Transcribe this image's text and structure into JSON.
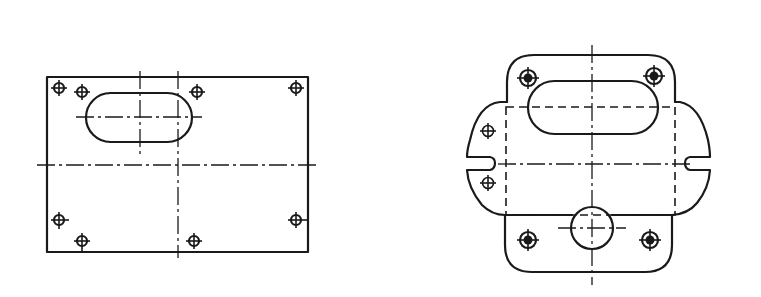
{
  "figure": {
    "type": "technical-drawing",
    "views": [
      {
        "id": "left-view",
        "description": "Rectangular plate with oblong slot and eight mounting holes",
        "outline_rect": {
          "x": 47,
          "y": 77,
          "w": 261,
          "h": 175
        },
        "slot": {
          "x": 86,
          "y": 93,
          "w": 106,
          "h": 49
        },
        "center_lines": {
          "horizontal": {
            "y": 165,
            "x1": 37,
            "x2": 318
          },
          "vertical_main": {
            "x": 178,
            "y1": 71,
            "y2": 258
          },
          "slot_horizontal": {
            "y": 117,
            "x1": 76,
            "x2": 202
          },
          "slot_vertical": {
            "x": 140,
            "y1": 71,
            "y2": 158
          }
        },
        "holes": [
          {
            "cx": 59,
            "cy": 88
          },
          {
            "cx": 82,
            "cy": 92
          },
          {
            "cx": 197,
            "cy": 92
          },
          {
            "cx": 296,
            "cy": 88
          },
          {
            "cx": 59,
            "cy": 220
          },
          {
            "cx": 82,
            "cy": 241
          },
          {
            "cx": 194,
            "cy": 241
          },
          {
            "cx": 296,
            "cy": 220
          }
        ]
      },
      {
        "id": "right-view",
        "description": "Plate with rounded lobes, side notches, oblong slot, hidden rectangle, and round boss",
        "center_x": 592,
        "slot": {
          "x": 528,
          "y": 81,
          "w": 130,
          "h": 53
        },
        "hidden_rect": {
          "x": 506,
          "y": 107,
          "w": 169,
          "h": 108
        },
        "boss_circle": {
          "cx": 592,
          "cy": 228,
          "r": 21
        },
        "center_lines": {
          "vertical": {
            "x": 592,
            "y1": 45,
            "y2": 285
          },
          "horizontal": {
            "y": 164,
            "x1": 498,
            "x2": 690
          },
          "boss_horizontal": {
            "y": 228,
            "x1": 558,
            "x2": 626
          }
        },
        "holes_large": [
          {
            "cx": 528,
            "cy": 78
          },
          {
            "cx": 654,
            "cy": 76
          },
          {
            "cx": 528,
            "cy": 240
          },
          {
            "cx": 650,
            "cy": 240
          }
        ],
        "holes_small": [
          {
            "cx": 488,
            "cy": 131
          },
          {
            "cx": 488,
            "cy": 183
          }
        ]
      }
    ]
  }
}
